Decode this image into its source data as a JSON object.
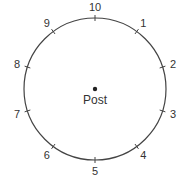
{
  "diagram": {
    "center_label": "Post",
    "positions": [
      {
        "label": "10",
        "angle_deg": 0
      },
      {
        "label": "1",
        "angle_deg": 36
      },
      {
        "label": "2",
        "angle_deg": 72
      },
      {
        "label": "3",
        "angle_deg": 108
      },
      {
        "label": "4",
        "angle_deg": 144
      },
      {
        "label": "5",
        "angle_deg": 180
      },
      {
        "label": "6",
        "angle_deg": 216
      },
      {
        "label": "7",
        "angle_deg": 252
      },
      {
        "label": "8",
        "angle_deg": 288
      },
      {
        "label": "9",
        "angle_deg": 324
      }
    ],
    "colors": {
      "stroke": "#444444",
      "text": "#333333"
    }
  }
}
